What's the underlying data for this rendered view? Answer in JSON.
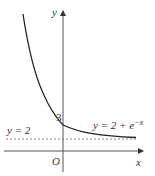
{
  "diagram": {
    "axes": {
      "x_label": "x",
      "y_label": "y",
      "origin_label": "O"
    },
    "y_intercept_label": "3",
    "asymptote_label": "y = 2",
    "curve_label_prefix": "y = 2 + e",
    "curve_label_exp": "−x",
    "colors": {
      "axis": "#444444",
      "curve": "#222222",
      "dashed": "#555555"
    }
  }
}
